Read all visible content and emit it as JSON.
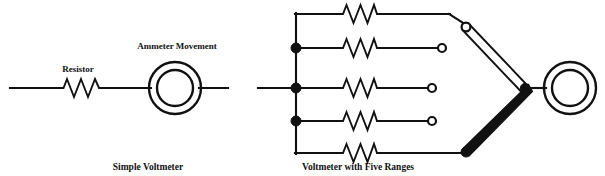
{
  "figure": {
    "background_color": "#ffffff",
    "ink_color": "#111111",
    "width": 605,
    "height": 176
  },
  "diagrams": [
    {
      "id": "simple-voltmeter",
      "caption": "Simple Voltmeter",
      "caption_x": 148,
      "caption_y": 170,
      "labels": [
        {
          "name": "resistor-label",
          "text": "Resistor",
          "x": 78,
          "y": 72
        },
        {
          "name": "meter-label",
          "text": "Ammeter Movement",
          "x": 177,
          "y": 49
        }
      ],
      "components": {
        "resistor": {
          "x1": 60,
          "x2": 102,
          "y": 88,
          "zigzags": 3,
          "amplitude": 9
        },
        "meter": {
          "cx": 175,
          "cy": 88,
          "outer_r": 26,
          "inner_r": 18
        },
        "lead_left": {
          "x1": 10,
          "x2": 60,
          "y": 88
        },
        "lead_mid": {
          "x1": 102,
          "x2": 149,
          "y": 88
        },
        "lead_right": {
          "x1": 201,
          "x2": 228,
          "y": 88
        }
      }
    },
    {
      "id": "five-range-voltmeter",
      "caption": "Voltmeter with Five Ranges",
      "caption_x": 358,
      "caption_y": 170,
      "labels": [],
      "components": {
        "input_lead": {
          "x1": 258,
          "x2": 296,
          "y": 88
        },
        "bus": {
          "x": 296,
          "y_top": 14,
          "y_bottom": 153
        },
        "bus_nodes": [
          {
            "x": 296,
            "y": 48
          },
          {
            "x": 296,
            "y": 88
          },
          {
            "x": 296,
            "y": 121
          }
        ],
        "branches": [
          {
            "index": 1,
            "y": 14,
            "res_x1": 338,
            "res_x2": 378,
            "run_to": 466,
            "terminal": "wiper-top",
            "terminal_type": "open"
          },
          {
            "index": 2,
            "y": 48,
            "res_x1": 338,
            "res_x2": 378,
            "run_to": 441,
            "terminal": "contact-2",
            "terminal_type": "open"
          },
          {
            "index": 3,
            "y": 88,
            "res_x1": 338,
            "res_x2": 378,
            "run_to": 432,
            "terminal": "contact-3",
            "terminal_type": "open"
          },
          {
            "index": 4,
            "y": 121,
            "res_x1": 338,
            "res_x2": 378,
            "run_to": 432,
            "terminal": "contact-4",
            "terminal_type": "open"
          },
          {
            "index": 5,
            "y": 153,
            "res_x1": 338,
            "res_x2": 378,
            "run_to": 466,
            "terminal": "contact-5",
            "terminal_type": "filled"
          }
        ],
        "switch": {
          "pivot": {
            "x": 524,
            "y": 88
          },
          "selected_contact": {
            "x": 466,
            "y": 27
          },
          "common_contact": {
            "x": 466,
            "y": 152
          },
          "arm_upper_style": "outline",
          "arm_lower_style": "solid"
        },
        "meter": {
          "cx": 570,
          "cy": 88,
          "outer_r": 26,
          "inner_r": 18
        },
        "meter_lead": {
          "x1": 524,
          "x2": 544,
          "y": 88
        }
      }
    }
  ]
}
